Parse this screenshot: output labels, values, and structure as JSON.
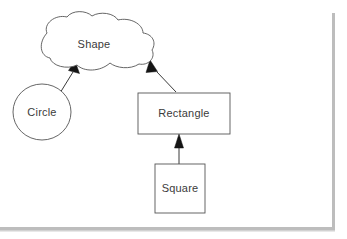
{
  "canvas": {
    "width": 347,
    "height": 239,
    "background_color": "#ffffff",
    "border_color": "#bdbdbd",
    "title": "Shape Diagram"
  },
  "diagram": {
    "type": "uml-generalization-diagram",
    "node_stroke_color": "#555555",
    "node_fill_color": "#ffffff",
    "label_color": "#3b3b3b",
    "edge_color": "#3a3a3a",
    "arrow_color": "#151515",
    "nodes": [
      {
        "id": "shape",
        "label": "Shape",
        "shape": "cloud",
        "x": 38,
        "y": 16,
        "width": 122,
        "height": 52,
        "label_x": 94,
        "label_y": 45
      },
      {
        "id": "circle",
        "label": "Circle",
        "shape": "ellipse",
        "cx": 42,
        "cy": 112,
        "rx": 29,
        "ry": 28,
        "label_x": 42,
        "label_y": 112
      },
      {
        "id": "rectangle",
        "label": "Rectangle",
        "shape": "rectangle",
        "x": 138,
        "y": 93,
        "width": 92,
        "height": 41,
        "label_x": 184,
        "label_y": 114
      },
      {
        "id": "square",
        "label": "Square",
        "shape": "rectangle",
        "x": 155,
        "y": 164,
        "width": 50,
        "height": 49,
        "label_x": 180,
        "label_y": 189
      }
    ],
    "edges": [
      {
        "id": "circle-to-shape",
        "from": "circle",
        "to": "shape",
        "kind": "generalization",
        "arrow_at": "to"
      },
      {
        "id": "rectangle-to-shape",
        "from": "rectangle",
        "to": "shape",
        "kind": "generalization",
        "arrow_at": "to"
      },
      {
        "id": "square-to-rectangle",
        "from": "square",
        "to": "rectangle",
        "kind": "generalization",
        "arrow_at": "to"
      }
    ]
  }
}
